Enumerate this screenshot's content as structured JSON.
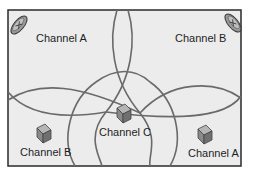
{
  "diagram": {
    "type": "wireless channel coverage map",
    "colors": {
      "background": "#ececec",
      "border": "#2a2a2a",
      "curve": "#6a6a6a",
      "icon_fill": "#8a8a8a",
      "text": "#1e1e1e"
    },
    "antennas": [
      {
        "name": "antenna-top-left",
        "icon": "satellite-dish-icon"
      },
      {
        "name": "antenna-top-right",
        "icon": "satellite-dish-icon"
      }
    ],
    "labels": {
      "top_left": "Channel A",
      "top_right": "Channel B",
      "bottom_left": "Channel B",
      "bottom_center": "Channel C",
      "bottom_right": "Channel A"
    },
    "access_points": [
      {
        "icon": "cube-icon",
        "channel": "Channel B"
      },
      {
        "icon": "cube-icon",
        "channel": "Channel C"
      },
      {
        "icon": "cube-icon",
        "channel": "Channel A"
      }
    ]
  }
}
